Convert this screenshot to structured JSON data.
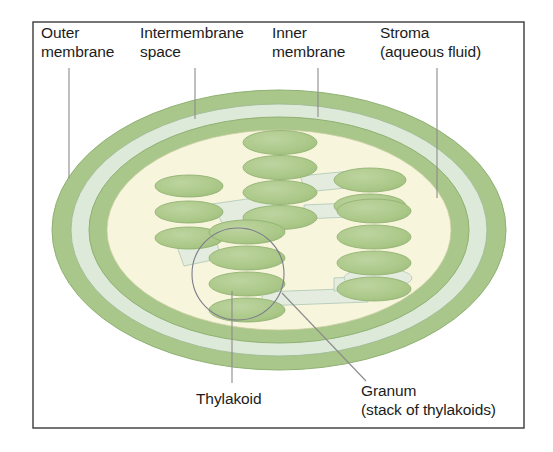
{
  "figure": {
    "frame": {
      "x": 33,
      "y": 22,
      "width": 491,
      "height": 406,
      "border_color": "#3a3a3a",
      "background_color": "#ffffff"
    }
  },
  "labels": {
    "outer_membrane": {
      "line1": "Outer",
      "line2": "membrane"
    },
    "intermembrane_space": {
      "line1": "Intermembrane",
      "line2": "space"
    },
    "inner_membrane": {
      "line1": "Inner",
      "line2": "membrane"
    },
    "stroma": {
      "line1": "Stroma",
      "line2": "(aqueous fluid)"
    },
    "thylakoid": {
      "line1": "Thylakoid",
      "line2": ""
    },
    "granum": {
      "line1": "Granum",
      "line2": "(stack of thylakoids)"
    }
  },
  "colors": {
    "outer_membrane": "#a9c68b",
    "intermembrane_space": "#dde9d9",
    "inner_membrane": "#a9c68b",
    "stroma": "#f8f5dd",
    "thylakoid_fill": "#abc888",
    "thylakoid_stroke": "#93b273",
    "lamella_fill": "#dfeade",
    "leader_line": "#8b8b8b",
    "callout_stroke": "#7c7c8c",
    "text": "#1c1c1c",
    "frame_border": "#3a3a3a",
    "page_background": "#ffffff"
  },
  "chloroplast": {
    "center_x": 279,
    "center_y": 230,
    "outer_membrane": {
      "rx": 227,
      "ry": 140
    },
    "intermembrane_space": {
      "rx": 208,
      "ry": 126
    },
    "inner_membrane": {
      "rx": 190,
      "ry": 113
    },
    "stroma": {
      "rx": 172,
      "ry": 100
    }
  },
  "grana": [
    {
      "name": "granum-left",
      "cx": 189,
      "cy": 212,
      "count": 3,
      "rx": 34,
      "ry": 11,
      "spacing": 26
    },
    {
      "name": "granum-center-upper",
      "cx": 280,
      "cy": 180,
      "count": 4,
      "rx": 37,
      "ry": 12,
      "spacing": 25
    },
    {
      "name": "granum-center-lower",
      "cx": 247,
      "cy": 271,
      "count": 4,
      "rx": 38,
      "ry": 12,
      "spacing": 26
    },
    {
      "name": "granum-right-upper",
      "cx": 370,
      "cy": 193,
      "count": 2,
      "rx": 36,
      "ry": 12,
      "spacing": 26
    },
    {
      "name": "granum-right-lower",
      "cx": 374,
      "cy": 250,
      "count": 4,
      "rx": 37,
      "ry": 12,
      "spacing": 26
    }
  ],
  "callout": {
    "name": "granum-callout-circle",
    "cx": 238,
    "cy": 274,
    "r": 46
  },
  "leaders": {
    "outer_membrane": {
      "x1": 69,
      "y1": 68,
      "x2": 69,
      "y2": 178
    },
    "intermembrane_space": {
      "x1": 195,
      "y1": 68,
      "x2": 195,
      "y2": 119
    },
    "inner_membrane": {
      "x1": 318,
      "y1": 68,
      "x2": 318,
      "y2": 117
    },
    "stroma": {
      "x1": 437,
      "y1": 68,
      "x2": 437,
      "y2": 198
    },
    "thylakoid": {
      "x1": 232,
      "y1": 291,
      "x2": 232,
      "y2": 383
    },
    "granum": {
      "x1": 282,
      "y1": 293,
      "x2": 366,
      "y2": 381
    }
  }
}
